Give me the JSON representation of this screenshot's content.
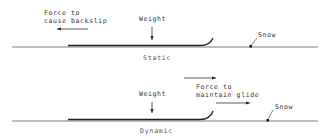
{
  "panels": {
    "static": {
      "caption": "Static",
      "force_label_line1": "Force to",
      "force_label_line2": "cause backslip",
      "force_direction": "left",
      "weight_label": "Weight",
      "snow_label": "Snow"
    },
    "dynamic": {
      "caption": "Dynamic",
      "force_label_line1": "Force to",
      "force_label_line2": "maintain glide",
      "force_direction": "right",
      "weight_label": "Weight",
      "snow_label": "Snow"
    }
  },
  "colors": {
    "line": "#333333",
    "ski": "#222222",
    "background": "#ffffff"
  }
}
